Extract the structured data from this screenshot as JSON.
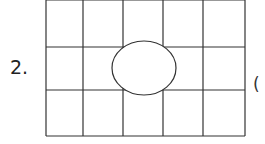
{
  "question": {
    "number": "2.",
    "paren": "("
  },
  "grid": {
    "rows": 3,
    "cols": 5,
    "x_lines": [
      46,
      83,
      123,
      163,
      203,
      245
    ],
    "y_lines": [
      0,
      47,
      90,
      136
    ],
    "line_color": "#333333"
  },
  "ellipse": {
    "cx": 144,
    "cy": 68,
    "rx": 32,
    "ry": 27,
    "fill": "#ffffff",
    "stroke": "#333333"
  }
}
